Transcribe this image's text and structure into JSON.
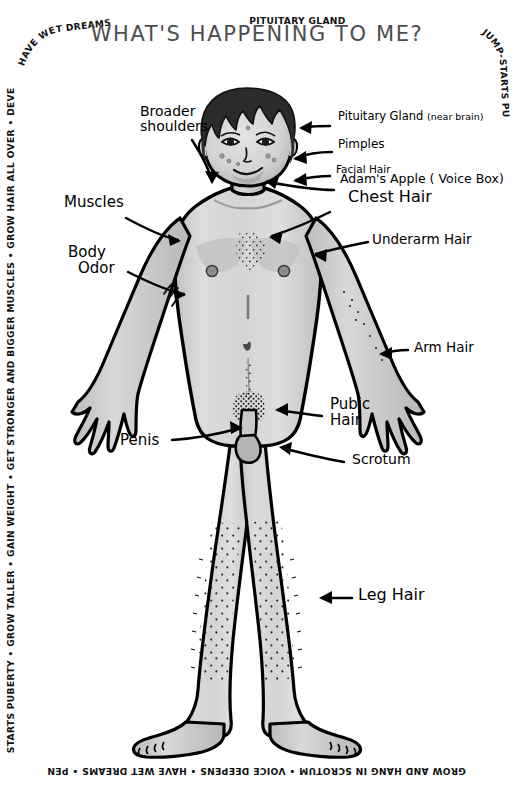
{
  "poster": {
    "title": "WHAT'S HAPPENING TO ME?",
    "title_color": "#4d4d4d",
    "background_color": "#ffffff",
    "ink_color": "#000000",
    "skin_color": "#d2d2d2",
    "hair_color": "#2b2b2b",
    "subject": "adolescent male body diagram"
  },
  "border_text": {
    "full_phrase": "PITUITARY GLAND JUMP-STARTS PUBERTY • GROW TALLER • GAIN WEIGHT • GET STRONGER AND BIGGER MUSCLES • GROW HAIR ALL OVER • DEVELOP BODY ODOR • TESTICLES GROW AND HANG IN SCROTUM • VOICE DEEPENS • HAVE WET DREAMS • PENIS GROWS •",
    "top": "PITUITARY GLAND",
    "right": "JUMP-STARTS PUBERTY • GROW TALLER • GAIN WEIGHT • GET STRONGER AND BIGGER MUSCLES • GROW HAIR ALL OVER • DEVELOP BODY ODOR • TESTICLES",
    "bottom": "GROW AND HANG IN SCROTUM • VOICE DEEPENS • HAVE WET DREAMS • PENIS GROWS • PITUITARY GLAND JUMP-",
    "left": "STARTS PUBERTY • GROW TALLER • GAIN WEIGHT • GET STRONGER AND BIGGER MUSCLES • GROW HAIR ALL OVER • DEVELOP BODY ODOR • VOICE DEEPENS •",
    "top_left": "HAVE WET DREAMS"
  },
  "labels": {
    "broader_shoulders": "Broader\nshoulders",
    "broader_shoulders_line1": "Broader",
    "broader_shoulders_line2": "shoulders",
    "muscles": "Muscles",
    "body_odor_line1": "Body",
    "body_odor_line2": "Odor",
    "penis": "Penis",
    "pituitary_gland": "Pituitary Gland",
    "pituitary_gland_note": "(near brain)",
    "pimples": "Pimples",
    "facial_hair": "Facial Hair",
    "adams_apple": "Adam's Apple ( Voice Box)",
    "chest_hair": "Chest Hair",
    "underarm_hair": "Underarm Hair",
    "arm_hair": "Arm Hair",
    "pubic_hair_line1": "Pubic",
    "pubic_hair_line2": "Hair",
    "scrotum": "Scrotum",
    "leg_hair": "Leg Hair"
  }
}
